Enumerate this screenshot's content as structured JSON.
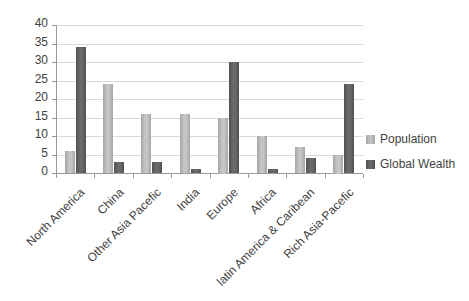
{
  "chart_data": {
    "type": "bar",
    "title": "",
    "xlabel": "",
    "ylabel": "",
    "categories": [
      "North America",
      "China",
      "Other Asia Pacefic",
      "India",
      "Europe",
      "Africa",
      "latin America & Caribean",
      "Rich Asia-Pacefic"
    ],
    "series": [
      {
        "name": "Population",
        "values": [
          6,
          24,
          16,
          16,
          15,
          10,
          7,
          5
        ],
        "color": "#c6c6c6",
        "color_edge": "#a6a6a6"
      },
      {
        "name": "Global Wealth",
        "values": [
          34,
          3,
          3,
          1,
          30,
          1,
          4,
          24
        ],
        "color": "#6b6b6b",
        "color_edge": "#515151"
      }
    ],
    "ylim": [
      0,
      40
    ],
    "ytick_step": 5,
    "y_tick_labels": [
      "0",
      "5",
      "10",
      "15",
      "20",
      "25",
      "30",
      "35",
      "40"
    ],
    "grid": true,
    "legend_position": "right"
  },
  "colors": {
    "background": "#ffffff",
    "gridline": "#d9d9d9",
    "axis": "#9a9a9a",
    "text": "#3f3f3f"
  }
}
